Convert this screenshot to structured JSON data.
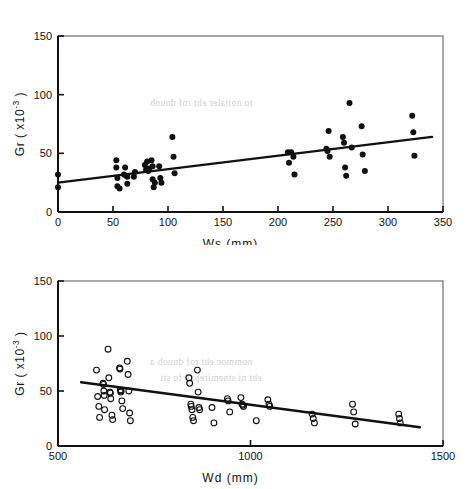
{
  "figure": {
    "background_color": "#ffffff",
    "ink_color": "#111111",
    "bleed_color": "#c9c9c9",
    "bleed_lines": [
      "to noitaler eht rof dnuob",
      "nommoc eht rof dnuob a",
      "eht ni stnemirepxe fo sti"
    ]
  },
  "chart_data": [
    {
      "id": "top",
      "type": "scatter",
      "title": "",
      "xlabel": "Ws (mm)",
      "ylabel": "Gr (x10-3)",
      "ylabel_base": "Gr ( x10",
      "ylabel_exp": "-3",
      "ylabel_close": " )",
      "xlim": [
        0,
        350
      ],
      "ylim": [
        0,
        150
      ],
      "xticks": [
        0,
        50,
        100,
        150,
        200,
        250,
        300,
        350
      ],
      "xticklabels": [
        "0",
        "50",
        "100",
        "150",
        "200",
        "250",
        "300",
        "350"
      ],
      "yticks": [
        0,
        50,
        100,
        150
      ],
      "yticklabels": [
        "0",
        "50",
        "100",
        "150"
      ],
      "grid": false,
      "legend": "none",
      "marker": "filled-circle",
      "marker_color": "#111111",
      "points": [
        [
          0,
          32
        ],
        [
          0,
          21
        ],
        [
          53,
          44
        ],
        [
          53,
          38
        ],
        [
          54,
          29
        ],
        [
          54,
          22
        ],
        [
          56,
          20
        ],
        [
          60,
          32
        ],
        [
          61,
          38
        ],
        [
          62,
          31
        ],
        [
          63,
          30
        ],
        [
          63,
          24
        ],
        [
          69,
          30
        ],
        [
          70,
          34
        ],
        [
          79,
          40
        ],
        [
          80,
          36
        ],
        [
          81,
          43
        ],
        [
          82,
          35
        ],
        [
          83,
          37
        ],
        [
          85,
          44
        ],
        [
          86,
          39
        ],
        [
          86,
          28
        ],
        [
          87,
          21
        ],
        [
          88,
          25
        ],
        [
          92,
          39
        ],
        [
          93,
          29
        ],
        [
          94,
          25
        ],
        [
          104,
          64
        ],
        [
          105,
          47
        ],
        [
          106,
          33
        ],
        [
          209,
          51
        ],
        [
          210,
          42
        ],
        [
          212,
          51
        ],
        [
          214,
          47
        ],
        [
          215,
          32
        ],
        [
          244,
          54
        ],
        [
          245,
          52
        ],
        [
          246,
          69
        ],
        [
          247,
          47
        ],
        [
          259,
          64
        ],
        [
          260,
          59
        ],
        [
          261,
          38
        ],
        [
          262,
          31
        ],
        [
          265,
          93
        ],
        [
          267,
          55
        ],
        [
          276,
          73
        ],
        [
          277,
          49
        ],
        [
          279,
          35
        ],
        [
          322,
          82
        ],
        [
          323,
          68
        ],
        [
          324,
          48
        ]
      ],
      "fit_line": {
        "label": "regression line",
        "x": [
          0,
          340
        ],
        "y": [
          25,
          64
        ],
        "color": "#111111"
      }
    },
    {
      "id": "bottom",
      "type": "scatter",
      "title": "",
      "xlabel": "Wd (mm)",
      "ylabel": "Gr (x10-3)",
      "ylabel_base": "Gr ( x10",
      "ylabel_exp": "-3",
      "ylabel_close": " )",
      "xlim": [
        500,
        1500
      ],
      "ylim": [
        0,
        150
      ],
      "xticks": [
        500,
        1000,
        1500
      ],
      "xticklabels": [
        "500",
        "1000",
        "1500"
      ],
      "yticks": [
        0,
        50,
        100,
        150
      ],
      "yticklabels": [
        "0",
        "50",
        "100",
        "150"
      ],
      "grid": false,
      "legend": "none",
      "marker": "open-circle",
      "marker_color": "#111111",
      "points": [
        [
          600,
          69
        ],
        [
          603,
          45
        ],
        [
          606,
          36
        ],
        [
          608,
          26
        ],
        [
          617,
          57
        ],
        [
          618,
          56
        ],
        [
          619,
          50
        ],
        [
          620,
          46
        ],
        [
          621,
          33
        ],
        [
          630,
          88
        ],
        [
          632,
          62
        ],
        [
          635,
          49
        ],
        [
          636,
          48
        ],
        [
          637,
          43
        ],
        [
          640,
          28
        ],
        [
          642,
          24
        ],
        [
          660,
          71
        ],
        [
          661,
          70
        ],
        [
          662,
          51
        ],
        [
          663,
          49
        ],
        [
          664,
          50
        ],
        [
          666,
          41
        ],
        [
          668,
          34
        ],
        [
          680,
          77
        ],
        [
          682,
          65
        ],
        [
          684,
          50
        ],
        [
          686,
          30
        ],
        [
          688,
          23
        ],
        [
          840,
          62
        ],
        [
          842,
          57
        ],
        [
          845,
          38
        ],
        [
          846,
          36
        ],
        [
          848,
          33
        ],
        [
          850,
          26
        ],
        [
          852,
          23
        ],
        [
          862,
          69
        ],
        [
          864,
          49
        ],
        [
          866,
          35
        ],
        [
          868,
          33
        ],
        [
          900,
          35
        ],
        [
          905,
          21
        ],
        [
          940,
          43
        ],
        [
          942,
          41
        ],
        [
          946,
          31
        ],
        [
          975,
          44
        ],
        [
          978,
          38
        ],
        [
          980,
          37
        ],
        [
          982,
          36
        ],
        [
          1015,
          23
        ],
        [
          1045,
          42
        ],
        [
          1048,
          38
        ],
        [
          1050,
          36
        ],
        [
          1160,
          29
        ],
        [
          1163,
          25
        ],
        [
          1166,
          21
        ],
        [
          1265,
          38
        ],
        [
          1268,
          31
        ],
        [
          1272,
          20
        ],
        [
          1385,
          29
        ],
        [
          1387,
          25
        ],
        [
          1389,
          21
        ]
      ],
      "fit_line": {
        "label": "regression line",
        "x": [
          560,
          1440
        ],
        "y": [
          58,
          17
        ],
        "color": "#111111"
      }
    }
  ]
}
